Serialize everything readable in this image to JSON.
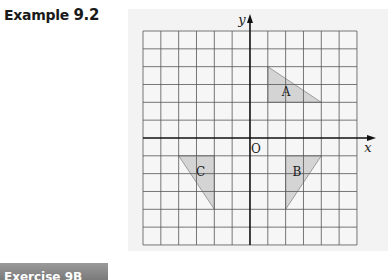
{
  "header": {
    "label": "Example",
    "number": "9.2",
    "marker_icon": "half-circle-marker-icon"
  },
  "figure": {
    "axis_labels": {
      "x": "x",
      "y": "y",
      "origin": "O"
    },
    "grid": {
      "xmin": -6,
      "xmax": 6,
      "ymin": -6,
      "ymax": 6,
      "step": 1
    },
    "shapes": [
      {
        "label": "A",
        "vertices": [
          [
            1,
            4
          ],
          [
            1,
            2
          ],
          [
            4,
            2
          ]
        ],
        "label_pos": [
          2,
          2.6
        ]
      },
      {
        "label": "B",
        "vertices": [
          [
            2,
            -1
          ],
          [
            4,
            -1
          ],
          [
            2,
            -4
          ]
        ],
        "label_pos": [
          2.6,
          -1.9
        ]
      },
      {
        "label": "C",
        "vertices": [
          [
            -4,
            -1
          ],
          [
            -2,
            -1
          ],
          [
            -2,
            -4
          ]
        ],
        "label_pos": [
          -2.8,
          -1.9
        ]
      }
    ],
    "colors": {
      "panel": "#f3f3f3",
      "grid": "#555555",
      "axis": "#111111",
      "shape_fill": "#d4d4d4",
      "shape_stroke": "#8a8a8a"
    }
  },
  "footer": {
    "bar_label": "Exercise 9B"
  }
}
